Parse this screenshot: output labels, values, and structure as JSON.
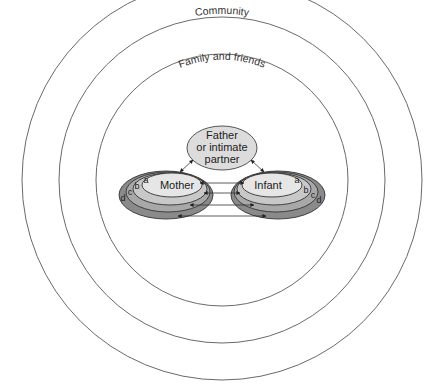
{
  "diagram": {
    "rings": [
      {
        "id": "outer",
        "label": "",
        "r": 200
      },
      {
        "id": "community",
        "label": "Community",
        "r": 163
      },
      {
        "id": "family",
        "label": "Family and friends",
        "r": 126
      }
    ],
    "center": {
      "x": 222,
      "y": 180
    },
    "nodes": {
      "partner": {
        "label_lines": [
          "Father",
          "or intimate",
          "partner"
        ]
      },
      "mother": {
        "label": "Mother",
        "layers": [
          "a",
          "b",
          "c",
          "d"
        ]
      },
      "infant": {
        "label": "Infant",
        "layers": [
          "a",
          "b",
          "c",
          "d"
        ]
      }
    },
    "edges": [
      {
        "from": "partner",
        "to": "mother",
        "type": "bidirectional"
      },
      {
        "from": "partner",
        "to": "infant",
        "type": "bidirectional"
      },
      {
        "from": "mother.a",
        "to": "infant.a",
        "type": "bidirectional"
      },
      {
        "from": "mother.b",
        "to": "infant.b",
        "type": "bidirectional"
      },
      {
        "from": "mother.c",
        "to": "infant.c",
        "type": "bidirectional"
      },
      {
        "from": "mother.d",
        "to": "infant.d",
        "type": "bidirectional"
      }
    ],
    "colors": {
      "ring_stroke": "#6a6a6a",
      "layer_a": "#e4e4e4",
      "layer_b": "#c8c8c8",
      "layer_c": "#a8a8a8",
      "layer_d": "#8a8a8a",
      "partner_fill": "#dcdcdc"
    }
  },
  "caption": {
    "text": ""
  }
}
